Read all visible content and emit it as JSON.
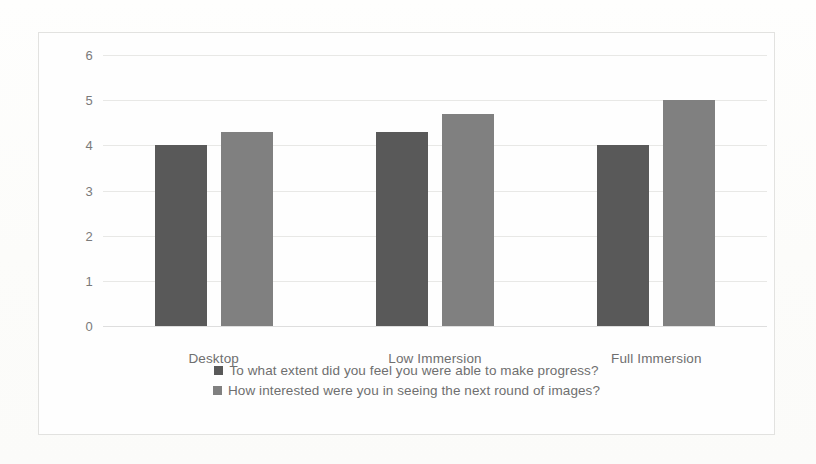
{
  "chart_data": {
    "type": "bar",
    "title": "",
    "xlabel": "",
    "ylabel": "",
    "categories": [
      "Desktop",
      "Low Immersion",
      "Full Immersion"
    ],
    "series": [
      {
        "name": "To what extent did you feel you were able to make progress?",
        "color": "#595959",
        "values": [
          4.0,
          4.3,
          4.0
        ]
      },
      {
        "name": "How interested were you in seeing the next round of images?",
        "color": "#808080",
        "values": [
          4.3,
          4.7,
          5.0
        ]
      }
    ],
    "ylim": [
      0,
      6
    ],
    "yticks": [
      0,
      1,
      2,
      3,
      4,
      5,
      6
    ],
    "ytick_labels": [
      "0",
      "1",
      "2",
      "3",
      "4",
      "5",
      "6"
    ],
    "grid": true,
    "grid_axis": "y",
    "legend_position": "bottom"
  },
  "colors": {
    "series_dark": "#595959",
    "series_light": "#808080",
    "gridline": "#e8e8e6",
    "axis_text": "#7a7a7a",
    "frame_border": "#e2e2e0",
    "background": "#fdfdfc"
  }
}
